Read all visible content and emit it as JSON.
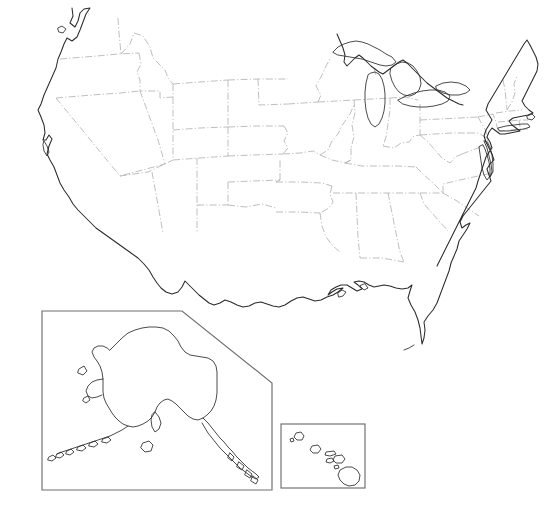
{
  "document": {
    "kind": "blank-outline-map",
    "title": "Blank United States Map",
    "width_px": 547,
    "height_px": 529,
    "background_color": "#ffffff",
    "has_text_labels": false,
    "caption": ""
  },
  "style": {
    "national_outline_color": "#2b2b2b",
    "national_outline_width_px": 1.05,
    "state_border_color": "#a9a9a9",
    "state_border_width_px": 0.75,
    "state_border_pattern": "dash-dot",
    "inset_frame_color": "#6e6e6e",
    "inset_frame_width_px": 1.15
  },
  "map": {
    "projection_hint": "conic, curved northern border",
    "regions": [
      {
        "name": "contiguous-united-states",
        "label": "",
        "inset": false
      },
      {
        "name": "alaska",
        "label": "",
        "inset": true
      },
      {
        "name": "hawaii",
        "label": "",
        "inset": true
      }
    ],
    "state_count": 48,
    "state_borders_visible": true
  },
  "insets": {
    "alaska": {
      "name": "alaska-inset",
      "label": "",
      "frame_shape": "rectangle-with-clipped-top-right-corner",
      "x": 42,
      "y": 311,
      "width": 230,
      "height": 179,
      "corner_cut_from_x": 182,
      "corner_cut_to_y": 383,
      "features": [
        "mainland-alaska",
        "aleutian-islands",
        "panhandle",
        "kodiak-island"
      ]
    },
    "hawaii": {
      "name": "hawaii-inset",
      "label": "",
      "frame_shape": "rectangle",
      "x": 281,
      "y": 424,
      "width": 84,
      "height": 64,
      "islands": [
        "Niihau",
        "Kauai",
        "Oahu",
        "Molokai",
        "Lanai",
        "Maui",
        "Kahoolawe",
        "Hawaii"
      ]
    }
  },
  "contiguous_bounds": {
    "x": 30,
    "y": 6,
    "width": 510,
    "height": 344
  }
}
